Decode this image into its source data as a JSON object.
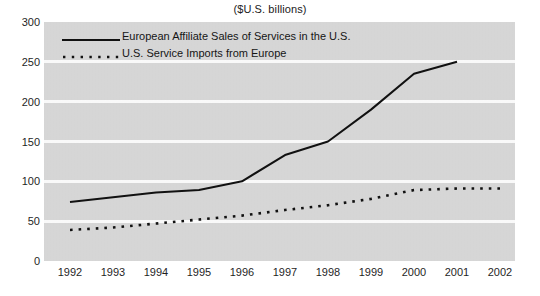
{
  "chart_data": {
    "type": "line",
    "title": "($U.S. billions)",
    "xlabel": "",
    "ylabel": "",
    "ylim": [
      0,
      300
    ],
    "ytick_values": [
      300,
      250,
      200,
      150,
      100,
      50,
      0
    ],
    "ytick_labels": [
      "300",
      "250",
      "200",
      "150",
      "100",
      "50",
      "0"
    ],
    "grid": true,
    "legend_position": "top-left inside plot",
    "categories": [
      "1992",
      "1993",
      "1994",
      "1995",
      "1996",
      "1997",
      "1998",
      "1999",
      "2000",
      "2001",
      "2002"
    ],
    "x": [
      1992,
      1993,
      1994,
      1995,
      1996,
      1997,
      1998,
      1999,
      2000,
      2001,
      2002
    ],
    "series": [
      {
        "name": "European Affiliate Sales of Services in the U.S.",
        "style": "solid",
        "color": "#111111",
        "values": [
          74,
          80,
          86,
          89,
          100,
          133,
          150,
          190,
          235,
          250,
          null
        ]
      },
      {
        "name": "U.S. Service Imports from Europe",
        "style": "dotted",
        "color": "#111111",
        "values": [
          39,
          42,
          47,
          52,
          57,
          64,
          70,
          78,
          89,
          91,
          91
        ]
      }
    ]
  },
  "legend": {
    "items": [
      {
        "label": "European Affiliate Sales of Services in the U.S.",
        "style": "solid"
      },
      {
        "label": "U.S. Service Imports from Europe",
        "style": "dotted"
      }
    ]
  }
}
